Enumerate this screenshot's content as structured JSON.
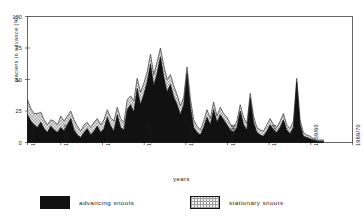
{
  "chart_data": {
    "type": "area",
    "title": "",
    "xlabel": "years",
    "ylabel": "glaciers in advance (%)",
    "ylim": [
      0,
      100
    ],
    "yticks": [
      0,
      25,
      50,
      75,
      100
    ],
    "grid": false,
    "stacked": true,
    "legend_position": "bottom",
    "xtick_labels": [
      "1891/92",
      "1899/00",
      "1909/10",
      "1919/20",
      "1929/30",
      "1939/40",
      "1949/50",
      "1959/60",
      "1969/70"
    ],
    "xtick_years": [
      1891,
      1899,
      1909,
      1919,
      1929,
      1939,
      1949,
      1959,
      1969
    ],
    "x_range": [
      1891,
      1969
    ],
    "data_end_year": 1962,
    "series": [
      {
        "name": "advancing snouts",
        "color": "#111111",
        "values": [
          22,
          17,
          14,
          12,
          16,
          11,
          8,
          13,
          10,
          8,
          12,
          9,
          14,
          19,
          10,
          6,
          4,
          8,
          11,
          6,
          9,
          13,
          8,
          11,
          20,
          13,
          9,
          22,
          12,
          10,
          26,
          30,
          24,
          43,
          30,
          38,
          48,
          62,
          45,
          55,
          68,
          52,
          40,
          46,
          36,
          30,
          22,
          30,
          55,
          28,
          12,
          8,
          6,
          12,
          20,
          14,
          26,
          16,
          22,
          18,
          14,
          10,
          8,
          12,
          25,
          14,
          10,
          35,
          16,
          8,
          6,
          5,
          9,
          14,
          10,
          8,
          12,
          18,
          10,
          7,
          12,
          48,
          14,
          5,
          4,
          3,
          2,
          1,
          1,
          1
        ]
      },
      {
        "name": "stationary snouts",
        "color": "#e9e9e9",
        "values": [
          12,
          10,
          9,
          11,
          8,
          7,
          6,
          5,
          7,
          6,
          9,
          8,
          7,
          6,
          8,
          7,
          5,
          6,
          5,
          6,
          7,
          6,
          6,
          7,
          6,
          7,
          8,
          6,
          7,
          6,
          8,
          7,
          9,
          8,
          10,
          9,
          8,
          8,
          9,
          9,
          7,
          9,
          10,
          8,
          9,
          8,
          7,
          6,
          5,
          7,
          6,
          5,
          4,
          5,
          6,
          5,
          6,
          5,
          6,
          5,
          6,
          5,
          4,
          5,
          5,
          6,
          5,
          4,
          5,
          4,
          4,
          4,
          5,
          5,
          4,
          4,
          5,
          5,
          4,
          4,
          5,
          3,
          4,
          3,
          2,
          2,
          1,
          1,
          1,
          1
        ]
      }
    ]
  },
  "legend": {
    "items": [
      {
        "label": "advancing snouts",
        "swatch": "solid-black"
      },
      {
        "label": "stationary snouts",
        "swatch": "dotted-grey"
      }
    ]
  }
}
